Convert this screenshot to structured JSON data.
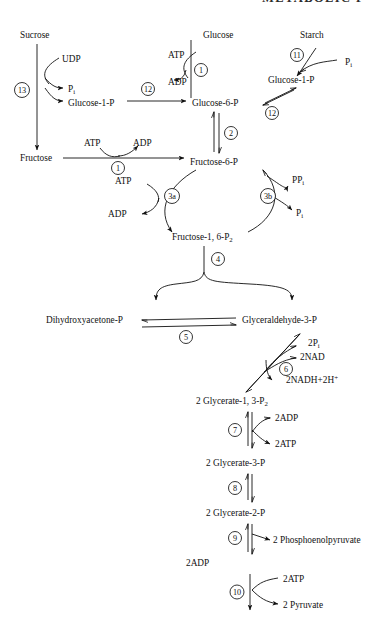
{
  "header": {
    "title": "METABOLIC P"
  },
  "diagram": {
    "type": "biochemical-pathway",
    "molecules": [
      {
        "id": "sucrose",
        "label": "Sucrose",
        "x": 20,
        "y": 38
      },
      {
        "id": "udp",
        "label": "UDP",
        "x": 62,
        "y": 62
      },
      {
        "id": "pi1",
        "label": "P",
        "sub": "i",
        "x": 68,
        "y": 89
      },
      {
        "id": "glucose1p_a",
        "label": "Glucose-1-P",
        "x": 68,
        "y": 103
      },
      {
        "id": "fructose",
        "label": "Fructose",
        "x": 20,
        "y": 157
      },
      {
        "id": "glucose",
        "label": "Glucose",
        "x": 203,
        "y": 38
      },
      {
        "id": "atp1",
        "label": "ATP",
        "x": 172,
        "y": 55
      },
      {
        "id": "adp1",
        "label": "ADP",
        "x": 172,
        "y": 82
      },
      {
        "id": "starch",
        "label": "Starch",
        "x": 300,
        "y": 38
      },
      {
        "id": "pi_starch",
        "label": "P",
        "sub": "i",
        "x": 345,
        "y": 62
      },
      {
        "id": "glucose1p_b",
        "label": "Glucose-1-P",
        "x": 268,
        "y": 80
      },
      {
        "id": "glucose6p",
        "label": "Glucose-6-P",
        "x": 192,
        "y": 103
      },
      {
        "id": "atp2",
        "label": "ATP",
        "x": 88,
        "y": 143
      },
      {
        "id": "adp2",
        "label": "ADP",
        "x": 137,
        "y": 143
      },
      {
        "id": "fructose6p",
        "label": "Fructose-6-P",
        "x": 190,
        "y": 162
      },
      {
        "id": "atp3",
        "label": "ATP",
        "x": 115,
        "y": 181
      },
      {
        "id": "adp3",
        "label": "ADP",
        "x": 108,
        "y": 213
      },
      {
        "id": "ppi",
        "label": "PP",
        "sub": "i",
        "x": 292,
        "y": 180
      },
      {
        "id": "pi_pfp",
        "label": "P",
        "sub": "i",
        "x": 296,
        "y": 213
      },
      {
        "id": "fructose16p2",
        "label": "Fructose-1, 6-P",
        "sub": "2",
        "x": 172,
        "y": 237
      },
      {
        "id": "dhap",
        "label": "Dihydroxyacetone-P",
        "x": 68,
        "y": 319
      },
      {
        "id": "g3p",
        "label": "Glyceraldehyde-3-P",
        "x": 250,
        "y": 319
      },
      {
        "id": "2pi",
        "label": "2P",
        "sub": "i",
        "x": 313,
        "y": 343
      },
      {
        "id": "2nad",
        "label": "2NAD",
        "x": 305,
        "y": 356
      },
      {
        "id": "2nadh",
        "label": "2NADH+2H",
        "sup": "+",
        "x": 290,
        "y": 380
      },
      {
        "id": "glycerate13p2",
        "label": "2 Glycerate-1, 3-P",
        "sub": "2",
        "x": 205,
        "y": 400
      },
      {
        "id": "2adp1",
        "label": "2ADP",
        "x": 275,
        "y": 418
      },
      {
        "id": "2atp1",
        "label": "2ATP",
        "x": 275,
        "y": 442
      },
      {
        "id": "glycerate3p",
        "label": "2 Glycerate-3-P",
        "x": 214,
        "y": 462
      },
      {
        "id": "glycerate2p",
        "label": "2 Glycerate-2-P",
        "x": 214,
        "y": 512
      },
      {
        "id": "2h2o",
        "label": "2H",
        "sub": "2",
        "label2": "O",
        "x": 277,
        "y": 537
      },
      {
        "id": "pep",
        "label": "2 Phosphoenolpyruvate",
        "x": 190,
        "y": 562
      },
      {
        "id": "2adp2",
        "label": "2ADP",
        "x": 283,
        "y": 580
      },
      {
        "id": "2atp2",
        "label": "2ATP",
        "x": 283,
        "y": 604
      },
      {
        "id": "pyruvate",
        "label": "2 Pyruvate",
        "x": 226,
        "y": 624
      }
    ],
    "steps": [
      {
        "id": "step1a",
        "number": "1",
        "x": 201,
        "y": 70,
        "r": 6.5,
        "enzyme": "hexokinase"
      },
      {
        "id": "step1b",
        "number": "1",
        "x": 118,
        "y": 160,
        "r": 6.5,
        "enzyme": "fructokinase"
      },
      {
        "id": "step2",
        "number": "2",
        "x": 228,
        "y": 132,
        "r": 6.5,
        "enzyme": "phosphoglucoisomerase"
      },
      {
        "id": "step3a",
        "number": "3a",
        "x": 169,
        "y": 196,
        "r": 7.5,
        "enzyme": "phosphofructokinase"
      },
      {
        "id": "step3b",
        "number": "3b",
        "x": 268,
        "y": 196,
        "r": 7.5,
        "enzyme": "PPi-phosphofructokinase"
      },
      {
        "id": "step4",
        "number": "4",
        "x": 186,
        "y": 262,
        "r": 6.5,
        "enzyme": "aldolase"
      },
      {
        "id": "step5",
        "number": "5",
        "x": 166,
        "y": 334,
        "r": 6.5,
        "enzyme": "triose phosphate isomerase"
      },
      {
        "id": "step6",
        "number": "6",
        "x": 283,
        "y": 366,
        "r": 6.5,
        "enzyme": "glyceraldehyde-3-P dehydrogenase"
      },
      {
        "id": "step7",
        "number": "7",
        "x": 235,
        "y": 430,
        "r": 6.5,
        "enzyme": "phosphoglycerate kinase"
      },
      {
        "id": "step8",
        "number": "8",
        "x": 238,
        "y": 488,
        "r": 6.5,
        "enzyme": "phosphoglycerate mutase"
      },
      {
        "id": "step9",
        "number": "9",
        "x": 238,
        "y": 538,
        "r": 6.5,
        "enzyme": "enolase"
      },
      {
        "id": "step10",
        "number": "10",
        "x": 238,
        "y": 592,
        "r": 7.0,
        "enzyme": "pyruvate kinase"
      },
      {
        "id": "step11",
        "number": "11",
        "x": 297,
        "y": 55,
        "r": 6.5,
        "enzyme": "starch phosphorylase"
      },
      {
        "id": "step12a",
        "number": "12",
        "x": 148,
        "y": 94,
        "r": 6.5,
        "enzyme": "phosphoglucomutase"
      },
      {
        "id": "step12b",
        "number": "12",
        "x": 270,
        "y": 110,
        "r": 6.5,
        "enzyme": "phosphoglucomutase"
      },
      {
        "id": "step13",
        "number": "13",
        "x": 22,
        "y": 90,
        "r": 7.5,
        "enzyme": "sucrose synthase"
      }
    ]
  }
}
